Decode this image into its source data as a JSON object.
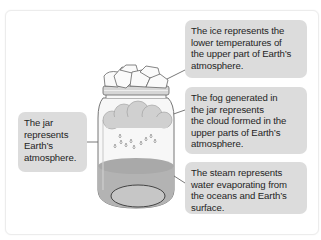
{
  "diagram": {
    "labels": {
      "ice": "The ice represents the\nlower temperatures of\nthe upper part of Earth’s\natmosphere.",
      "fog": "The fog generated in\nthe jar represents\nthe cloud formed in the\nupper parts of Earth’s\natmosphere.",
      "steam": "The steam represents\nwater evaporating from\nthe oceans and Earth’s\nsurface.",
      "jar": "The jar\nrepresents\nEarth’s\natmosphere."
    },
    "colors": {
      "label_box": "#dcdcdc",
      "label_text": "#1f1f1f",
      "line": "#555555",
      "water": "#b3b3b3",
      "cloud": "#d0d0d0"
    }
  }
}
